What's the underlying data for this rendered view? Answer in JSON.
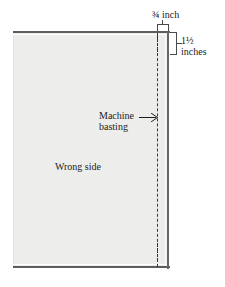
{
  "diagram": {
    "kind": "sewing-fabric-diagram",
    "fabric": {
      "surface_label": "Wrong side",
      "fill_color": "#ededec",
      "edge_color": "#5d5d5d"
    },
    "stitch_line": {
      "label_line_1": "Machine",
      "label_line_2": "basting",
      "style": "dashed",
      "color": "#3a3a3a"
    },
    "dimensions": {
      "top": {
        "value": "¾ inch",
        "orientation": "horizontal",
        "bracket_color": "#4a4a4a"
      },
      "right": {
        "value_line_1": "1½",
        "value_line_2": "inches",
        "orientation": "vertical",
        "bracket_color": "#4a4a4a"
      }
    }
  }
}
